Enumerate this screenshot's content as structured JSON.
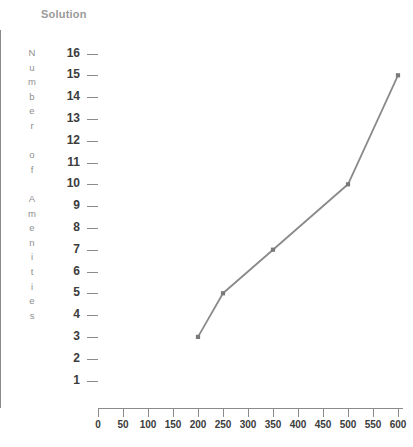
{
  "chart_data": {
    "type": "line",
    "title": "Solution",
    "xlabel": "",
    "ylabel": "Number of Amenities",
    "ylabel_letters": [
      "N",
      "u",
      "m",
      "b",
      "e",
      "r",
      "",
      "o",
      "f",
      "",
      "A",
      "m",
      "e",
      "n",
      "i",
      "t",
      "i",
      "e",
      "s"
    ],
    "x": [
      200,
      250,
      350,
      500,
      600
    ],
    "values": [
      3,
      5,
      7,
      10,
      15
    ],
    "points": [
      {
        "x": 200,
        "y": 3
      },
      {
        "x": 250,
        "y": 5
      },
      {
        "x": 350,
        "y": 7
      },
      {
        "x": 500,
        "y": 10
      },
      {
        "x": 600,
        "y": 15
      }
    ],
    "series": [
      {
        "name": "Solution",
        "values": [
          3,
          5,
          7,
          10,
          15
        ]
      }
    ],
    "xlim": [
      0,
      610
    ],
    "ylim": [
      0,
      16.6
    ],
    "xticks": [
      0,
      50,
      100,
      150,
      200,
      250,
      300,
      350,
      400,
      450,
      500,
      550,
      600
    ],
    "xtick_labels": [
      "0",
      "50",
      "100",
      "150",
      "200",
      "250",
      "300",
      "350",
      "400",
      "450",
      "500",
      "550",
      "600"
    ],
    "yticks": [
      1,
      2,
      3,
      4,
      5,
      6,
      7,
      8,
      9,
      10,
      11,
      12,
      13,
      14,
      15,
      16
    ],
    "ytick_labels": [
      "1",
      "2",
      "3",
      "4",
      "5",
      "6",
      "7",
      "8",
      "9",
      "10",
      "11",
      "12",
      "13",
      "14",
      "15",
      "16"
    ],
    "grid": false,
    "legend": "none",
    "marker": "square",
    "line_color": "#8a8a8a",
    "marker_color": "#7a7a7a",
    "axis_color": "#8a8a8a",
    "title_color": "#9a9a9a",
    "tick_label_color": "#3c3c3c"
  }
}
